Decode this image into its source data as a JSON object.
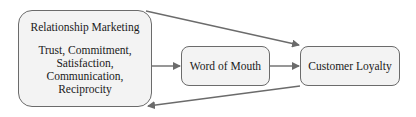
{
  "diagram": {
    "nodes": {
      "relationship_marketing": {
        "title": "Relationship Marketing",
        "factors": [
          "Trust, Commitment,",
          "Satisfaction,",
          "Communication,",
          "Reciprocity"
        ]
      },
      "word_of_mouth": {
        "label": "Word of Mouth"
      },
      "customer_loyalty": {
        "label": "Customer Loyalty"
      }
    },
    "edges": [
      {
        "from": "Relationship Marketing",
        "to": "Word of Mouth"
      },
      {
        "from": "Word of Mouth",
        "to": "Customer Loyalty"
      },
      {
        "from": "Relationship Marketing",
        "to": "Customer Loyalty"
      },
      {
        "from": "Customer Loyalty",
        "to": "Relationship Marketing"
      }
    ],
    "colors": {
      "stroke": "#6b6b6b",
      "fill": "#f3f3f3",
      "text": "#1a1a1a"
    }
  }
}
